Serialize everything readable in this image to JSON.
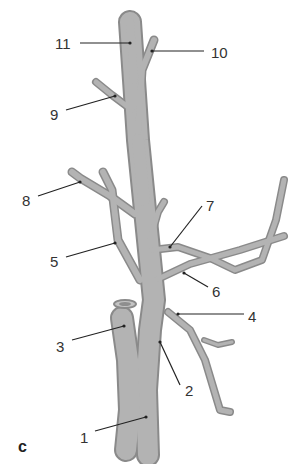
{
  "figure": {
    "panel_label": "c",
    "colors": {
      "vessel_fill": "#a9a9a9",
      "vessel_edge": "#8a8a8a",
      "vessel_light": "#c4c4c4",
      "leader_line": "#222222",
      "label_text": "#333333",
      "background": "#ffffff"
    },
    "labels": [
      {
        "id": "1",
        "text": "1"
      },
      {
        "id": "2",
        "text": "2"
      },
      {
        "id": "3",
        "text": "3"
      },
      {
        "id": "4",
        "text": "4"
      },
      {
        "id": "5",
        "text": "5"
      },
      {
        "id": "6",
        "text": "6"
      },
      {
        "id": "7",
        "text": "7"
      },
      {
        "id": "8",
        "text": "8"
      },
      {
        "id": "9",
        "text": "9"
      },
      {
        "id": "10",
        "text": "10"
      },
      {
        "id": "11",
        "text": "11"
      }
    ]
  }
}
